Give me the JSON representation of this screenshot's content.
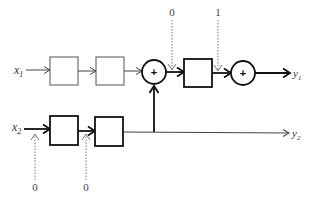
{
  "diagram": {
    "type": "block-diagram",
    "inputs": [
      {
        "name": "x",
        "sub": "1"
      },
      {
        "name": "x",
        "sub": "2"
      }
    ],
    "outputs": [
      {
        "name": "y",
        "sub": "1"
      },
      {
        "name": "y",
        "sub": "2"
      }
    ],
    "summers": [
      {
        "symbol": "+"
      },
      {
        "symbol": "+"
      }
    ],
    "dotted_inputs": [
      {
        "value": "0"
      },
      {
        "value": "1"
      },
      {
        "value": "0"
      },
      {
        "value": "0"
      }
    ],
    "colors": {
      "stroke": "#111111",
      "light_stroke": "#555555",
      "dotted": "#777777",
      "background": "#ffffff"
    }
  }
}
